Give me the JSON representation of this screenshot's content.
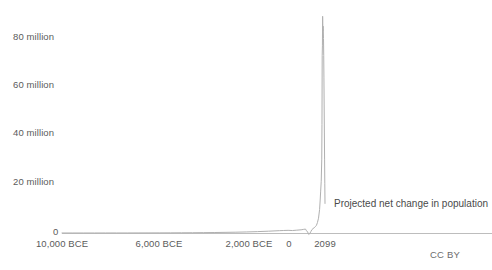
{
  "chart_data": {
    "type": "line",
    "title": "",
    "subtitle": "",
    "xlabel": "",
    "ylabel": "",
    "grid": false,
    "legend_position": "inline-annotation",
    "series": [
      {
        "name": "Projected net change in population",
        "annotation": "Projected net change in population",
        "color": "#b0b0b0",
        "x": [
          -10000,
          -9500,
          -9000,
          -8500,
          -8000,
          -7500,
          -7000,
          -6500,
          -6000,
          -5500,
          -5000,
          -4500,
          -4000,
          -3500,
          -3000,
          -2500,
          -2000,
          -1500,
          -1000,
          -500,
          0,
          200,
          400,
          600,
          800,
          1000,
          1100,
          1200,
          1250,
          1300,
          1350,
          1400,
          1450,
          1500,
          1550,
          1600,
          1650,
          1700,
          1750,
          1800,
          1850,
          1875,
          1900,
          1925,
          1950,
          1960,
          1970,
          1980,
          1990,
          2000,
          2010,
          2020,
          2030,
          2040,
          2050,
          2060,
          2070,
          2080,
          2090,
          2099
        ],
        "values": [
          8000,
          9000,
          11000,
          13000,
          16000,
          20000,
          25000,
          32000,
          40000,
          52000,
          68000,
          88000,
          115000,
          150000,
          195000,
          255000,
          330000,
          430000,
          560000,
          730000,
          950000,
          1020000,
          1080000,
          1000000,
          1150000,
          1300000,
          1450000,
          1600000,
          900000,
          400000,
          -600000,
          -200000,
          600000,
          1400000,
          1800000,
          2100000,
          2600000,
          3000000,
          4200000,
          6000000,
          9500000,
          13000000,
          17000000,
          21000000,
          30000000,
          44000000,
          72000000,
          76000000,
          88000000,
          82000000,
          84000000,
          83000000,
          79000000,
          72000000,
          63000000,
          52000000,
          41000000,
          30000000,
          20000000,
          12000000
        ]
      }
    ],
    "y_axis": {
      "ticks": [
        {
          "value": 0,
          "label": "0",
          "y_px": 233
        },
        {
          "value": 20000000,
          "label": "20 million",
          "y_px": 181
        },
        {
          "value": 40000000,
          "label": "40 million",
          "y_px": 132
        },
        {
          "value": 60000000,
          "label": "60 million",
          "y_px": 84
        },
        {
          "value": 80000000,
          "label": "80 million",
          "y_px": 36
        }
      ],
      "range": [
        0,
        90000000
      ],
      "tick_suffix": "million"
    },
    "x_axis": {
      "ticks": [
        {
          "value": -10000,
          "label": "10,000 BCE",
          "x_px": 62
        },
        {
          "value": -6000,
          "label": "6,000 BCE",
          "x_px": 159
        },
        {
          "value": -2000,
          "label": "2,000 BCE",
          "x_px": 249
        },
        {
          "value": 0,
          "label": "0",
          "x_px": 289
        },
        {
          "value": 2099,
          "label": "2099",
          "x_px": 325
        }
      ],
      "range": [
        -10000,
        2099
      ]
    }
  },
  "footer": {
    "license": "CC BY"
  },
  "colors": {
    "background": "#ffffff",
    "axis_line": "#bdbdbd",
    "series_line": "#b0b0b0",
    "tick_text": "#5b5b5b",
    "annotation_text": "#4a4a4a",
    "license_text": "#6d6d6d"
  }
}
